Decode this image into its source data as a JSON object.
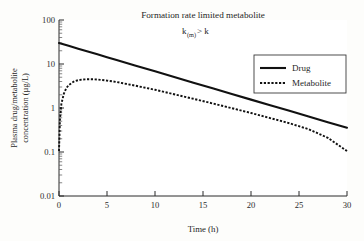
{
  "chart_data": {
    "type": "line",
    "title": "Formation rate limited metabolite",
    "subtitle_prefix": "k",
    "subtitle_sub": "(m)",
    "subtitle_suffix": " > k",
    "subtitle": "k(m) > k",
    "xlabel": "Time (h)",
    "ylabel_line1": "Plasma drug/metabolite",
    "ylabel_line2": "concentration (µg/L)",
    "ylabel": "Plasma drug/metabolite concentration (µg/L)",
    "yscale": "log",
    "xlim": [
      0,
      30
    ],
    "ylim": [
      0.01,
      100
    ],
    "xticks": [
      0,
      5,
      10,
      15,
      20,
      25,
      30
    ],
    "xtick_labels": [
      "0",
      "5",
      "10",
      "15",
      "20",
      "25",
      "30"
    ],
    "yticks": [
      0.01,
      0.1,
      1,
      10,
      100
    ],
    "ytick_labels": [
      "0.01",
      "0.1",
      "1",
      "10",
      "100"
    ],
    "grid": false,
    "legend_position": "upper right",
    "legend_entries": [
      "Drug",
      "Metabolite"
    ],
    "series": [
      {
        "name": "Drug",
        "style": "solid",
        "color": "#111111",
        "x": [
          0,
          1,
          2,
          3,
          4,
          5,
          6,
          8,
          10,
          12,
          14,
          16,
          18,
          20,
          22,
          24,
          26,
          28,
          30
        ],
        "values": [
          30.0,
          25.9,
          22.3,
          19.2,
          16.6,
          14.3,
          12.3,
          9.16,
          6.81,
          5.07,
          3.77,
          2.81,
          2.09,
          1.55,
          1.16,
          0.861,
          0.641,
          0.477,
          0.355
        ]
      },
      {
        "name": "Metabolite",
        "style": "dotted",
        "color": "#111111",
        "x": [
          0,
          0.1,
          0.25,
          0.5,
          0.75,
          1,
          1.5,
          2,
          2.5,
          3,
          3.4,
          4,
          5,
          6,
          8,
          10,
          12,
          14,
          16,
          18,
          20,
          22,
          24,
          26,
          28,
          30
        ],
        "values": [
          0.105,
          0.55,
          1.25,
          2.1,
          2.8,
          3.3,
          3.95,
          4.3,
          4.45,
          4.5,
          4.5,
          4.45,
          4.2,
          3.9,
          3.2,
          2.6,
          2.05,
          1.62,
          1.27,
          0.99,
          0.77,
          0.59,
          0.45,
          0.33,
          0.21,
          0.105
        ]
      }
    ],
    "annotations": [
      {
        "text": "metabolite peaks ~4.5 µg/L near t = 3.4 h",
        "visible": false
      }
    ]
  },
  "geometry": {
    "plot_left": 59,
    "plot_right": 347,
    "plot_top": 20,
    "plot_bottom": 196
  }
}
